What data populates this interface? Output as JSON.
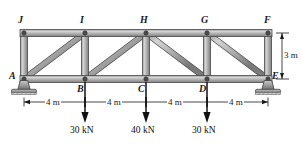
{
  "figure": {
    "type": "howe-truss-free-body-diagram"
  },
  "joints": [
    {
      "id": "A",
      "label": "A",
      "x": 24,
      "y": 79,
      "chord": "bottom"
    },
    {
      "id": "B",
      "label": "B",
      "x": 85,
      "y": 79,
      "chord": "bottom"
    },
    {
      "id": "C",
      "label": "C",
      "x": 146,
      "y": 79,
      "chord": "bottom"
    },
    {
      "id": "D",
      "label": "D",
      "x": 207,
      "y": 79,
      "chord": "bottom"
    },
    {
      "id": "E",
      "label": "E",
      "x": 268,
      "y": 79,
      "chord": "bottom"
    },
    {
      "id": "F",
      "label": "F",
      "x": 268,
      "y": 33,
      "chord": "top"
    },
    {
      "id": "G",
      "label": "G",
      "x": 207,
      "y": 33,
      "chord": "top"
    },
    {
      "id": "H",
      "label": "H",
      "x": 146,
      "y": 33,
      "chord": "top"
    },
    {
      "id": "I",
      "label": "I",
      "x": 85,
      "y": 33,
      "chord": "top"
    },
    {
      "id": "J",
      "label": "J",
      "x": 24,
      "y": 33,
      "chord": "top"
    }
  ],
  "members": [
    {
      "name": "bottom-chord-A-E",
      "from": "A",
      "to": "E",
      "kind": "chord"
    },
    {
      "name": "top-chord-J-F",
      "from": "J",
      "to": "F",
      "kind": "chord"
    },
    {
      "name": "vertical-A-J",
      "from": "A",
      "to": "J",
      "kind": "vertical"
    },
    {
      "name": "vertical-B-I",
      "from": "B",
      "to": "I",
      "kind": "vertical"
    },
    {
      "name": "vertical-C-H",
      "from": "C",
      "to": "H",
      "kind": "vertical"
    },
    {
      "name": "vertical-D-G",
      "from": "D",
      "to": "G",
      "kind": "vertical"
    },
    {
      "name": "vertical-E-F",
      "from": "E",
      "to": "F",
      "kind": "vertical"
    },
    {
      "name": "diagonal-A-I",
      "from": "A",
      "to": "I",
      "kind": "diagonal"
    },
    {
      "name": "diagonal-B-H",
      "from": "B",
      "to": "H",
      "kind": "diagonal"
    },
    {
      "name": "diagonal-H-D",
      "from": "H",
      "to": "D",
      "kind": "diagonal"
    },
    {
      "name": "diagonal-G-E",
      "from": "G",
      "to": "E",
      "kind": "diagonal"
    }
  ],
  "supports": [
    {
      "name": "pin-support-A",
      "at": "A",
      "x": 24,
      "y": 79,
      "type": "pin"
    },
    {
      "name": "pin-support-E",
      "at": "E",
      "x": 268,
      "y": 79,
      "type": "pin"
    }
  ],
  "loads": [
    {
      "name": "load-at-B",
      "at": "B",
      "x": 85,
      "magnitude": "30 kN",
      "direction": "down"
    },
    {
      "name": "load-at-C",
      "at": "C",
      "x": 146,
      "magnitude": "40 kN",
      "direction": "down"
    },
    {
      "name": "load-at-D",
      "at": "D",
      "x": 207,
      "magnitude": "30 kN",
      "direction": "down"
    }
  ],
  "dimensions": {
    "horizontal": [
      {
        "name": "span-A-B",
        "label": "4 m",
        "from_x": 24,
        "to_x": 85
      },
      {
        "name": "span-B-C",
        "label": "4 m",
        "from_x": 85,
        "to_x": 146
      },
      {
        "name": "span-C-D",
        "label": "4 m",
        "from_x": 146,
        "to_x": 207
      },
      {
        "name": "span-D-E",
        "label": "4 m",
        "from_x": 207,
        "to_x": 268
      }
    ],
    "vertical": [
      {
        "name": "height-E-F",
        "label": "3 m",
        "from_y": 33,
        "to_y": 79
      }
    ]
  },
  "colors": {
    "member_fill": "#b4b4b4",
    "member_fill_light": "#d2d2d2",
    "member_edge": "#4a4a4a",
    "joint_pin": "#3a3a3a",
    "support_fill": "#9a9a9a",
    "support_edge": "#3c3c3c",
    "ink": "#1a1a1a",
    "background": "#ffffff"
  }
}
